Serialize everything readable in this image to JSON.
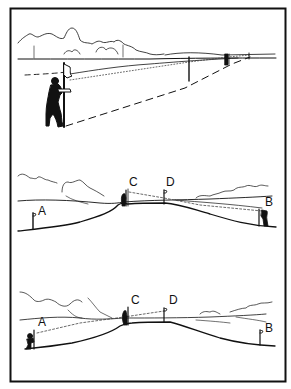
{
  "figure": {
    "panels": [
      {
        "id": "panel-1",
        "labels": []
      },
      {
        "id": "panel-2",
        "labels": {
          "a": "A",
          "b": "B",
          "c": "C",
          "d": "D"
        }
      },
      {
        "id": "panel-3",
        "labels": {
          "a": "A",
          "b": "B",
          "c": "C",
          "d": "D"
        }
      }
    ],
    "colors": {
      "ink": "#111111",
      "paper": "#ffffff",
      "dotted": "#444444"
    }
  }
}
